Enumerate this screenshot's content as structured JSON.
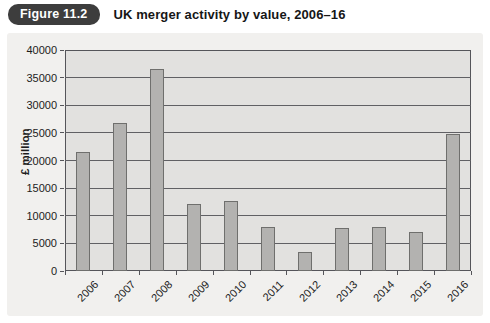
{
  "figure": {
    "badge": "Figure 11.2",
    "title": "UK merger activity by value, 2006–16"
  },
  "chart_data": {
    "type": "bar",
    "categories": [
      "2006",
      "2007",
      "2008",
      "2009",
      "2010",
      "2011",
      "2012",
      "2013",
      "2014",
      "2015",
      "2016"
    ],
    "values": [
      21500,
      26800,
      36500,
      12200,
      12600,
      8000,
      3400,
      7700,
      8000,
      7000,
      24800
    ],
    "title": "",
    "xlabel": "",
    "ylabel": "£ million",
    "ylim": [
      0,
      40000
    ],
    "ytick_step": 5000,
    "grid": true,
    "legend": "none"
  },
  "colors": {
    "badge_bg": "#3d3d3d",
    "badge_text": "#ffffff",
    "panel_bg": "#f1f0ee",
    "plot_bg": "#e2e1df",
    "bar_fill": "#b3b2b0",
    "bar_border": "#6f6f6d",
    "gridline": "#606064",
    "axis": "#55555a",
    "text": "#1c1c1c"
  }
}
